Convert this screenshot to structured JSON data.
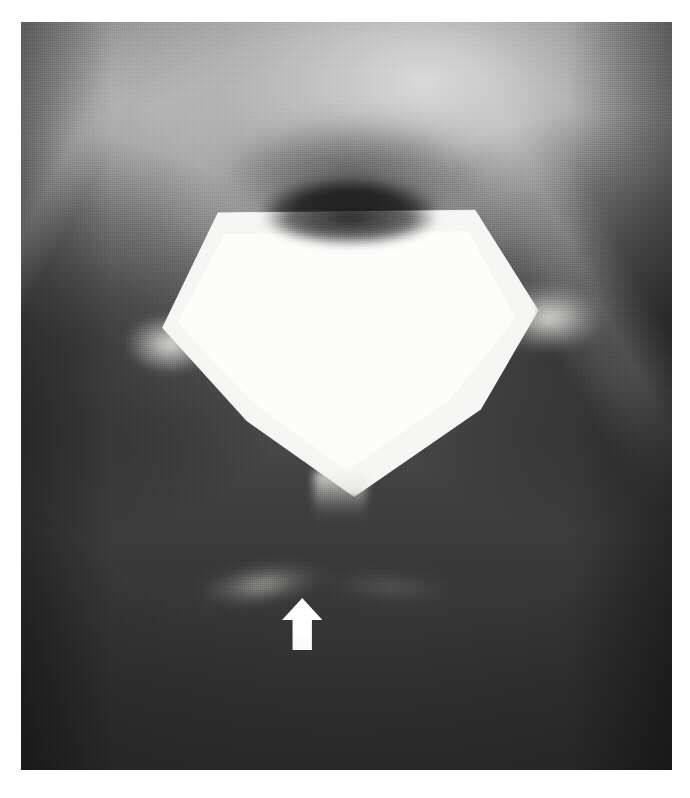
{
  "figure": {
    "kind": "radiograph",
    "modality_label": "plain radiograph",
    "plate": {
      "background_color": "#3a3a3a",
      "left": 21,
      "top": 22,
      "width": 651,
      "height": 748
    },
    "annotations": [
      {
        "name": "white-arrow",
        "glyph": "↑",
        "direction": "up",
        "color": "#ffffff",
        "points_to": "faint radiolucent streak inferior to the central contrast collection"
      }
    ],
    "structures": [
      {
        "name": "central-contrast-collection",
        "appearance": "rhomboid / diamond-shaped high-density opacity",
        "brightness": "#fdfdfc"
      },
      {
        "name": "superior-dark-lens",
        "appearance": "lenticular lucency capping the opacity",
        "brightness": "#101010"
      },
      {
        "name": "left-lateral-wing",
        "appearance": "tapering lateral extension",
        "brightness": "#f0f0ee"
      },
      {
        "name": "right-lateral-wing",
        "appearance": "tapering lateral extension",
        "brightness": "#f0f0ee"
      },
      {
        "name": "inferior-beak",
        "appearance": "caudal tapering beak",
        "brightness": "#f5f5f3"
      },
      {
        "name": "superior-arch",
        "appearance": "faint bony arch in upper field",
        "brightness": "#c8c8c8"
      },
      {
        "name": "indicated-streak",
        "appearance": "faint linear density marked by the arrow",
        "brightness": "#b9b9b6"
      }
    ]
  },
  "caption": {
    "text": ""
  }
}
